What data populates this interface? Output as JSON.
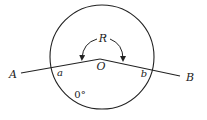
{
  "diagram": {
    "type": "geometry",
    "circle": {
      "cx": 102,
      "cy": 57,
      "r": 52
    },
    "points": {
      "A": {
        "label": "A",
        "x": 21,
        "y": 73
      },
      "O": {
        "label": "O",
        "x": 100,
        "y": 59
      },
      "B": {
        "label": "B",
        "x": 180,
        "y": 76
      }
    },
    "labels": {
      "A": "A",
      "B": "B",
      "O": "O",
      "R": "R",
      "a": "a",
      "b": "b",
      "zero": "0°"
    },
    "colors": {
      "stroke": "#222222",
      "background": "#ffffff"
    }
  }
}
